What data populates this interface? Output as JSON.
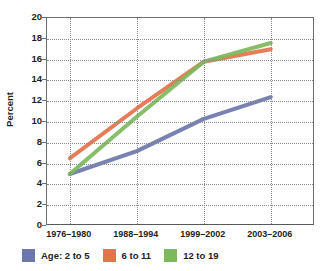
{
  "chart_data": {
    "type": "line",
    "title": "",
    "xlabel": "",
    "ylabel": "Percent",
    "categories": [
      "1976–1980",
      "1988–1994",
      "1999–2002",
      "2003–2006"
    ],
    "ylim": [
      0,
      20
    ],
    "yticks": [
      0,
      2,
      4,
      6,
      8,
      10,
      12,
      14,
      16,
      18,
      20
    ],
    "grid": "dotted-both",
    "legend_position": "bottom-left",
    "series": [
      {
        "name": "Age: 2 to 5",
        "legend_label": "Age: 2 to 5",
        "color": "#6b77ad",
        "values": [
          5.0,
          7.2,
          10.3,
          12.4
        ]
      },
      {
        "name": "6 to 11",
        "legend_label": "6 to 11",
        "color": "#e3734a",
        "values": [
          6.5,
          11.3,
          15.8,
          17.0
        ]
      },
      {
        "name": "12 to 19",
        "legend_label": "12 to 19",
        "color": "#7db85c",
        "values": [
          5.0,
          10.5,
          15.8,
          17.6
        ]
      }
    ]
  },
  "axis": {
    "y_title": "Percent",
    "y_labels": [
      "20",
      "18",
      "16",
      "14",
      "12",
      "10",
      "8",
      "6",
      "4",
      "2",
      "0"
    ],
    "x_labels": [
      "1976–1980",
      "1988–1994",
      "1999–2002",
      "2003–2006"
    ]
  },
  "legend": {
    "items": [
      {
        "label": "Age: 2 to 5",
        "color": "#6b77ad"
      },
      {
        "label": "6 to 11",
        "color": "#e3734a"
      },
      {
        "label": "12 to 19",
        "color": "#7db85c"
      }
    ]
  }
}
